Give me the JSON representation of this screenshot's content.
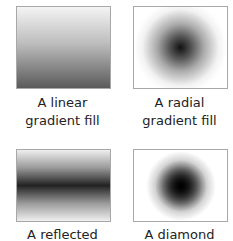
{
  "panels": [
    {
      "id": "linear",
      "caption_line1": "A linear",
      "caption_line2": "gradient fill"
    },
    {
      "id": "radial",
      "caption_line1": "A radial",
      "caption_line2": "gradient fill"
    },
    {
      "id": "reflected",
      "caption_line1": "A reflected",
      "caption_line2": ""
    },
    {
      "id": "diamond",
      "caption_line1": "A diamond",
      "caption_line2": ""
    }
  ],
  "colors": {
    "border": "#a8a8a8",
    "dark": "#111111",
    "light": "#ffffff",
    "text": "#222222"
  }
}
